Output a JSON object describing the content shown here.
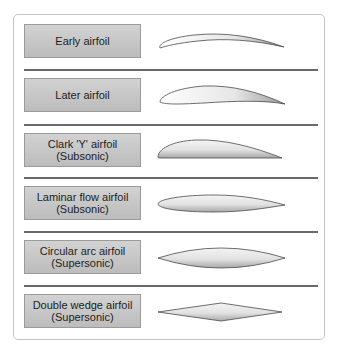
{
  "diagram": {
    "rows": [
      {
        "label": "Early airfoil"
      },
      {
        "label": "Later airfoil"
      },
      {
        "label": "Clark 'Y' airfoil\n(Subsonic)"
      },
      {
        "label": "Laminar flow airfoil\n(Subsonic)"
      },
      {
        "label": "Circular arc airfoil\n(Supersonic)"
      },
      {
        "label": "Double wedge airfoil\n(Supersonic)"
      }
    ],
    "colors": {
      "label_fill": "#c8c8c8",
      "divider": "#6a6a6a",
      "outline": "#4a4a4a"
    }
  }
}
